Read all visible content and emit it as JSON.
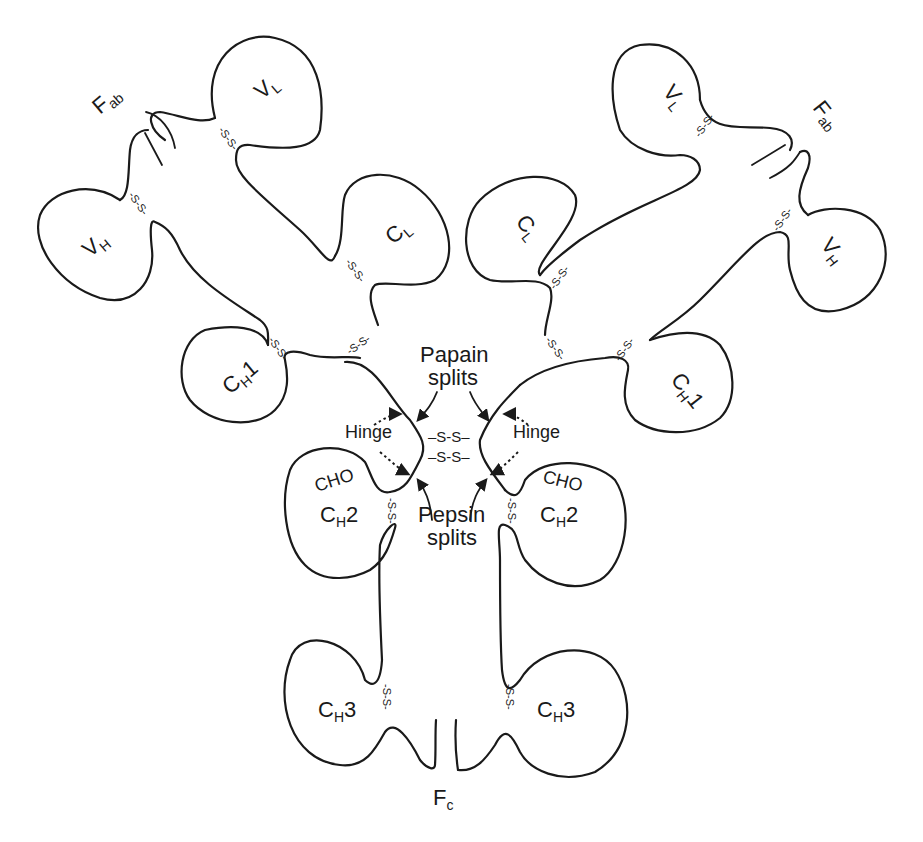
{
  "diagram": {
    "stroke_color": "#1a1a1a",
    "background": "#ffffff",
    "fragments": {
      "fab_left": {
        "main": "F",
        "sub": "ab"
      },
      "fab_right": {
        "main": "F",
        "sub": "ab"
      },
      "fc": {
        "main": "F",
        "sub": "c"
      }
    },
    "domains": {
      "vl_left": {
        "main": "V",
        "sub": "L"
      },
      "vh_left": {
        "main": "V",
        "sub": "H"
      },
      "cl_left": {
        "main": "C",
        "sub": "L"
      },
      "ch1_left": {
        "main": "C",
        "sub": "H",
        "suffix": "1"
      },
      "vl_right": {
        "main": "V",
        "sub": "L"
      },
      "vh_right": {
        "main": "V",
        "sub": "H"
      },
      "cl_right": {
        "main": "C",
        "sub": "L"
      },
      "ch1_right": {
        "main": "C",
        "sub": "H",
        "suffix": "1"
      },
      "ch2_left": {
        "main": "C",
        "sub": "H",
        "suffix": "2"
      },
      "ch2_right": {
        "main": "C",
        "sub": "H",
        "suffix": "2"
      },
      "ch3_left": {
        "main": "C",
        "sub": "H",
        "suffix": "3"
      },
      "ch3_right": {
        "main": "C",
        "sub": "H",
        "suffix": "3"
      }
    },
    "annotations": {
      "papain_line1": "Papain",
      "papain_line2": "splits",
      "pepsin_line1": "Pepsin",
      "pepsin_line2": "splits",
      "hinge_left": "Hinge",
      "hinge_right": "Hinge",
      "cho_left": "CHO",
      "cho_right": "CHO"
    },
    "disulfide": {
      "intrachain": "-S-S-",
      "interchain": "–S-S–"
    }
  }
}
